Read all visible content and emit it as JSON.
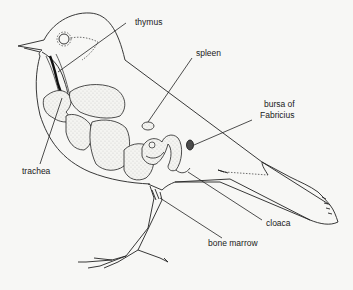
{
  "diagram": {
    "labels": {
      "thymus": "thymus",
      "spleen": "spleen",
      "bursa_line1": "bursa of",
      "bursa_line2": "Fabricius",
      "trachea": "trachea",
      "cloaca": "cloaca",
      "bone_marrow": "bone marrow"
    },
    "colors": {
      "ink": "#222222",
      "background": "#f7f7f5"
    }
  }
}
